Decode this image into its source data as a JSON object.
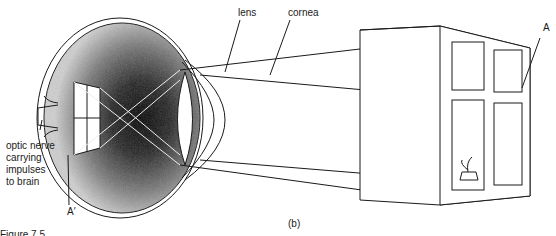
{
  "labels": {
    "lens": "lens",
    "cornea": "cornea",
    "object_point": "A",
    "image_point": "A′",
    "optic_nerve": [
      "optic nerve",
      "carrying",
      "impulses",
      "to brain"
    ],
    "panel": "(b)",
    "caption_fragment": "Figure 7.5"
  },
  "diagram": {
    "objects": [
      "eyeball",
      "lens",
      "cornea",
      "retina image of window",
      "window with potted plant",
      "light rays"
    ]
  }
}
